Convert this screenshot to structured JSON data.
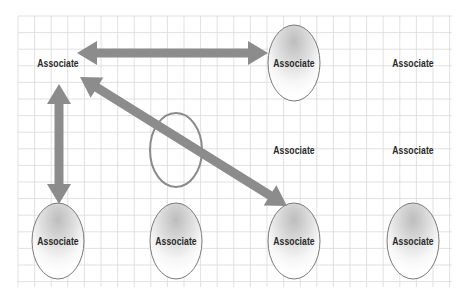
{
  "diagram": {
    "type": "relationship-diagram",
    "background": {
      "color": "#ffffff",
      "grid_color": "#d9d9d9",
      "grid_bounds": [
        18,
        16,
        452,
        287
      ],
      "cell_size": 16.6
    },
    "colors": {
      "arrow": "#8c8c8c",
      "ellipse_stroke": "#7a7a7a",
      "ellipse_shade": "#c8c8c8",
      "open_ellipse_stroke": "#8a8a8a",
      "text": "#2a2a2a"
    },
    "nodes": [
      {
        "id": "n1",
        "label": "Associate",
        "x": 58,
        "y": 63,
        "shape": "none"
      },
      {
        "id": "n2",
        "label": "Associate",
        "x": 294,
        "y": 63,
        "shape": "ellipse"
      },
      {
        "id": "n3",
        "label": "Associate",
        "x": 413,
        "y": 63,
        "shape": "none"
      },
      {
        "id": "n4",
        "label": "Associate",
        "x": 294,
        "y": 150,
        "shape": "none"
      },
      {
        "id": "n5",
        "label": "Associate",
        "x": 413,
        "y": 150,
        "shape": "none"
      },
      {
        "id": "n6",
        "label": "Associate",
        "x": 58,
        "y": 241,
        "shape": "ellipse"
      },
      {
        "id": "n7",
        "label": "Associate",
        "x": 176,
        "y": 241,
        "shape": "ellipse"
      },
      {
        "id": "n8",
        "label": "Associate",
        "x": 294,
        "y": 241,
        "shape": "ellipse"
      },
      {
        "id": "n9",
        "label": "Associate",
        "x": 413,
        "y": 241,
        "shape": "ellipse"
      }
    ],
    "open_ellipse": {
      "cx": 176,
      "cy": 150,
      "rx": 26,
      "ry": 37
    },
    "arrows": [
      {
        "from": "n1",
        "to": "n2",
        "direction": "both",
        "x1": 77,
        "y1": 53,
        "x2": 268,
        "y2": 53
      },
      {
        "from": "n1",
        "to": "n6",
        "direction": "both",
        "x1": 59,
        "y1": 84,
        "x2": 59,
        "y2": 204
      },
      {
        "from": "n1",
        "to": "n8",
        "direction": "both",
        "x1": 80,
        "y1": 77,
        "x2": 287,
        "y2": 206
      }
    ]
  }
}
